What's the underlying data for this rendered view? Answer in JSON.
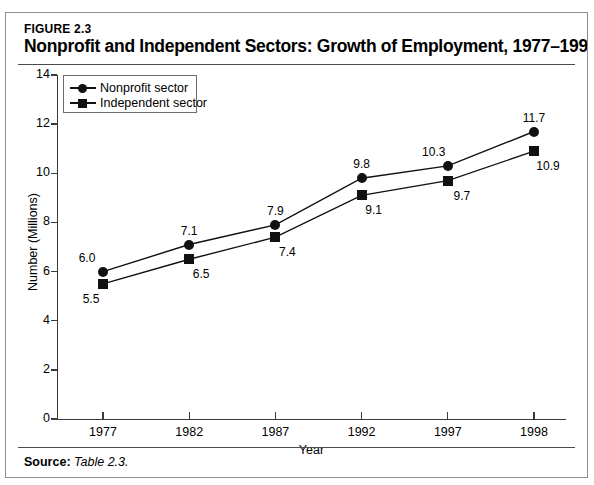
{
  "figure": {
    "number_label": "FIGURE 2.3",
    "title": "Nonprofit and Independent Sectors: Growth of Employment, 1977–1998",
    "source_prefix": "Source:",
    "source_text": "Table 2.3."
  },
  "chart_data": {
    "type": "line",
    "title": "Nonprofit and Independent Sectors: Growth of Employment, 1977–1998",
    "xlabel": "Year",
    "ylabel": "Number (Millions)",
    "categories": [
      "1977",
      "1982",
      "1987",
      "1992",
      "1997",
      "1998"
    ],
    "ylim": [
      0,
      14
    ],
    "yticks": [
      "0",
      "2",
      "4",
      "6",
      "8",
      "10",
      "12",
      "14"
    ],
    "grid": false,
    "legend_position": "top-left",
    "series": [
      {
        "name": "Nonprofit sector",
        "marker": "circle",
        "color": "#111111",
        "values": [
          6.0,
          7.1,
          7.9,
          9.8,
          10.3,
          11.7
        ],
        "labels": [
          "6.0",
          "7.1",
          "7.9",
          "9.8",
          "10.3",
          "11.7"
        ]
      },
      {
        "name": "Independent sector",
        "marker": "square",
        "color": "#111111",
        "values": [
          5.5,
          6.5,
          7.4,
          9.1,
          9.7,
          10.9
        ],
        "labels": [
          "5.5",
          "6.5",
          "7.4",
          "9.1",
          "9.7",
          "10.9"
        ]
      }
    ]
  }
}
